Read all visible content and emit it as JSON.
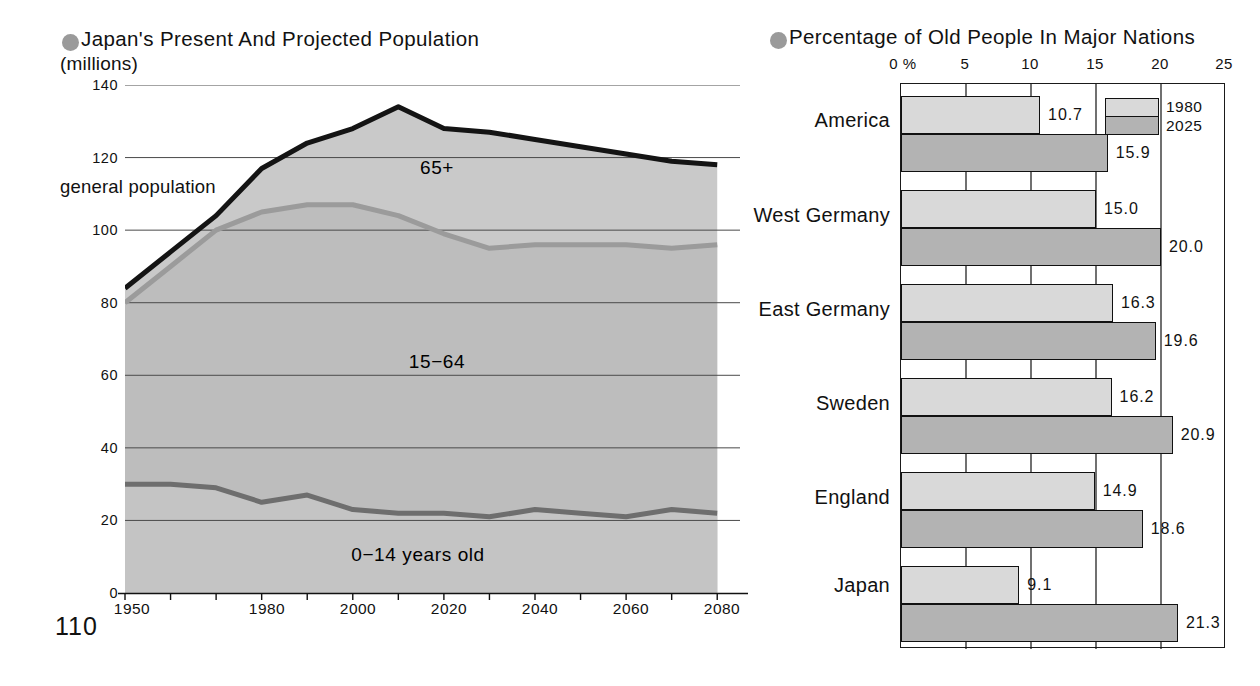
{
  "left": {
    "title": "Japan's Present And Projected Population",
    "subtitle": "(millions)",
    "bullet_color": "#9a9a9a",
    "annotations": {
      "general_population": "general population",
      "band_65plus": "65+",
      "band_15_64": "15−64",
      "band_0_14": "0−14 years old"
    },
    "page_number": "110",
    "chart_data": {
      "type": "area",
      "title": "Japan's Present And Projected Population",
      "xlabel": "",
      "ylabel": "(millions)",
      "xlim": [
        1950,
        2085
      ],
      "ylim": [
        0,
        140
      ],
      "grid": true,
      "x_ticks": [
        "1950",
        "1980",
        "2000",
        "2020",
        "2040",
        "2060",
        "2080"
      ],
      "x_tick_values": [
        1950,
        1980,
        2000,
        2020,
        2040,
        2060,
        2080
      ],
      "y_ticks": [
        "0",
        "20",
        "40",
        "60",
        "80",
        "100",
        "120",
        "140"
      ],
      "y_tick_values": [
        0,
        20,
        40,
        60,
        80,
        100,
        120,
        140
      ],
      "x": [
        1950,
        1960,
        1970,
        1980,
        1990,
        2000,
        2010,
        2020,
        2030,
        2040,
        2050,
        2060,
        2070,
        2080
      ],
      "series": [
        {
          "name": "general population",
          "label": "general population",
          "color": "#111111",
          "values": [
            84,
            94,
            104,
            117,
            124,
            128,
            134,
            128,
            127,
            125,
            123,
            121,
            119,
            118
          ]
        },
        {
          "name": "0-64 (upper bound of 15-64 band)",
          "label": "15−64",
          "color": "#8c8c8c",
          "values": [
            80,
            90,
            100,
            105,
            107,
            107,
            104,
            99,
            95,
            96,
            96,
            96,
            95,
            96
          ]
        },
        {
          "name": "0-14",
          "label": "0−14 years old",
          "color": "#5a5a5a",
          "values": [
            30,
            30,
            29,
            25,
            27,
            23,
            22,
            22,
            21,
            23,
            22,
            21,
            23,
            22
          ]
        }
      ]
    }
  },
  "right": {
    "title": "Percentage of Old People In Major Nations",
    "bullet_color": "#9a9a9a",
    "legend": [
      {
        "label": "1980",
        "color": "#d9d9d9"
      },
      {
        "label": "2025",
        "color": "#b3b3b3"
      }
    ],
    "chart_data": {
      "type": "bar",
      "orientation": "horizontal",
      "title": "Percentage of Old People In Major Nations",
      "xlabel": "%",
      "ylabel": "",
      "xlim": [
        0,
        25
      ],
      "grid": true,
      "legend_position": "top-right",
      "x_ticks": [
        "0 %",
        "5",
        "10",
        "15",
        "20",
        "25"
      ],
      "x_tick_values": [
        0,
        5,
        10,
        15,
        20,
        25
      ],
      "categories": [
        "America",
        "West Germany",
        "East Germany",
        "Sweden",
        "England",
        "Japan"
      ],
      "series": [
        {
          "name": "1980",
          "values": [
            10.7,
            15.0,
            16.3,
            16.2,
            14.9,
            9.1
          ],
          "labels": [
            "10.7",
            "15.0",
            "16.3",
            "16.2",
            "14.9",
            "9.1"
          ]
        },
        {
          "name": "2025",
          "values": [
            15.9,
            20.0,
            19.6,
            20.9,
            18.6,
            21.3
          ],
          "labels": [
            "15.9",
            "20.0",
            "19.6",
            "20.9",
            "18.6",
            "21.3"
          ]
        }
      ]
    }
  }
}
